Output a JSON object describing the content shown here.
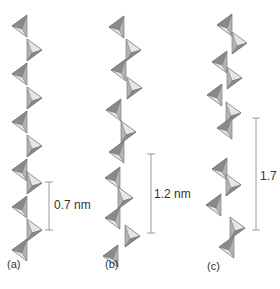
{
  "figure": {
    "panels": [
      {
        "id": "a",
        "label": "(a)",
        "dimension": "0.7 nm",
        "repeat_units": 1
      },
      {
        "id": "b",
        "label": "(b)",
        "dimension": "1.2 nm",
        "repeat_units": 2
      },
      {
        "id": "c",
        "label": "(c)",
        "dimension": "1.7 nm",
        "repeat_units": 3
      }
    ],
    "colors": {
      "light_face": "#e6e6e6",
      "mid_face": "#b4b4b4",
      "dark_face": "#8a8a8a",
      "edge": "#6e6e6e",
      "scale_bar": "#9a9a9a",
      "text": "#333333"
    }
  }
}
